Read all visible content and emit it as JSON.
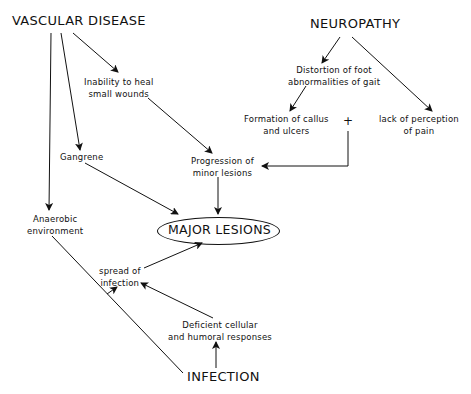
{
  "diagram": {
    "nodes": {
      "vascular_disease": "VASCULAR  DISEASE",
      "neuropathy": "NEUROPATHY",
      "inability_heal": [
        "Inability  to  heal",
        "small  wounds"
      ],
      "distortion_foot": [
        "Distortion  of  foot",
        "abnormalities  of  gait"
      ],
      "formation_callus": [
        "Formation  of  callus",
        "and  ulcers"
      ],
      "plus": "+",
      "lack_perception": [
        "lack  of  perception",
        "of  pain"
      ],
      "gangrene": "Gangrene",
      "progression": [
        "Progression   of",
        "minor   lesions"
      ],
      "anaerobic": [
        "Anaerobic",
        "environment"
      ],
      "major_lesions": "MAJOR  LESIONS",
      "spread_infection": [
        "spread  of",
        "infection"
      ],
      "deficient_responses": [
        "Deficient  cellular",
        "and  humoral  responses"
      ],
      "infection": "INFECTION"
    },
    "edges": [
      {
        "from": "VASCULAR DISEASE",
        "to": "Inability to heal small wounds"
      },
      {
        "from": "VASCULAR DISEASE",
        "to": "Gangrene"
      },
      {
        "from": "VASCULAR DISEASE",
        "to": "Anaerobic environment"
      },
      {
        "from": "Inability to heal small wounds",
        "to": "Progression of minor lesions"
      },
      {
        "from": "NEUROPATHY",
        "to": "Distortion of foot abnormalities of gait"
      },
      {
        "from": "NEUROPATHY",
        "to": "lack of perception of pain"
      },
      {
        "from": "Distortion of foot abnormalities of gait",
        "to": "Formation of callus and ulcers"
      },
      {
        "from": "Formation of callus and ulcers + lack of perception of pain",
        "to": "Progression of minor lesions"
      },
      {
        "from": "Gangrene",
        "to": "MAJOR LESIONS"
      },
      {
        "from": "Progression of minor lesions",
        "to": "MAJOR LESIONS"
      },
      {
        "from": "Anaerobic environment",
        "to": "spread of infection"
      },
      {
        "from": "spread of infection",
        "to": "MAJOR LESIONS"
      },
      {
        "from": "Deficient cellular and humoral responses",
        "to": "spread of infection"
      },
      {
        "from": "INFECTION",
        "to": "Deficient cellular and humoral responses"
      },
      {
        "from": "INFECTION",
        "to": "spread of infection"
      }
    ]
  }
}
